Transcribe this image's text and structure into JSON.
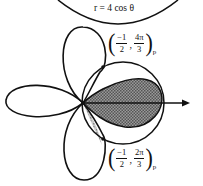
{
  "diagram": {
    "equation_label": "r = 4 cos θ",
    "point_upper": {
      "r_num": "−1",
      "r_den": "2",
      "theta_num": "4π",
      "theta_den": "3",
      "subscript": "p"
    },
    "point_lower": {
      "r_num": "−1",
      "r_den": "2",
      "theta_num": "2π",
      "theta_den": "3",
      "subscript": "p"
    },
    "colors": {
      "stroke": "#111111",
      "shade": "#8a8a8a",
      "background": "#ffffff"
    }
  }
}
